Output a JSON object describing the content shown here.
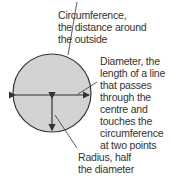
{
  "diagram": {
    "colors": {
      "fill": "#d3d3d3",
      "stroke": "#333333",
      "text": "#333333"
    },
    "labels": {
      "circumference": [
        "Circumference,",
        "the distance around",
        "the outside"
      ],
      "diameter": [
        "Diameter, the",
        "length of a line",
        "that passes",
        "through the",
        "centre and",
        "touches the",
        "circumference",
        "at two points"
      ],
      "radius": [
        "Radius, half",
        "the diameter"
      ]
    }
  }
}
